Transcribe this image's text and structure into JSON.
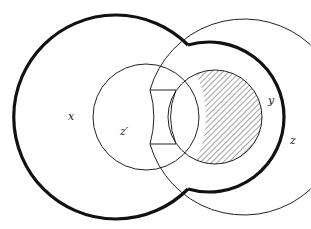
{
  "diagram": {
    "labels": {
      "x": "x",
      "y": "y",
      "z": "z",
      "z_prime": "z′"
    },
    "colors": {
      "stroke": "#111111",
      "hatch": "#333333",
      "background": "#ffffff"
    }
  }
}
